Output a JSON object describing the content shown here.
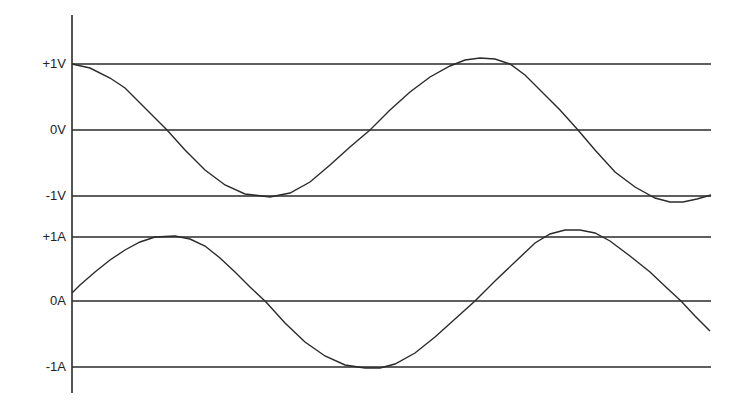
{
  "colors": {
    "line": "#2a2a2a",
    "background": "#ffffff"
  },
  "axis": {
    "x": 72,
    "y_top": 15,
    "y_bottom": 393,
    "x_end": 711
  },
  "voltage": {
    "labels": [
      {
        "text": "+1V",
        "y": 64
      },
      {
        "text": "0V",
        "y": 130
      },
      {
        "text": "-1V",
        "y": 196
      }
    ],
    "points": [
      [
        72,
        64
      ],
      [
        90,
        68
      ],
      [
        110,
        78
      ],
      [
        125,
        88
      ],
      [
        140,
        103
      ],
      [
        155,
        118
      ],
      [
        167,
        130
      ],
      [
        185,
        150
      ],
      [
        205,
        170
      ],
      [
        225,
        185
      ],
      [
        245,
        194
      ],
      [
        270,
        197
      ],
      [
        290,
        193
      ],
      [
        310,
        182
      ],
      [
        330,
        165
      ],
      [
        350,
        147
      ],
      [
        370,
        130
      ],
      [
        390,
        110
      ],
      [
        410,
        92
      ],
      [
        430,
        77
      ],
      [
        450,
        66
      ],
      [
        465,
        60
      ],
      [
        480,
        58
      ],
      [
        495,
        59
      ],
      [
        510,
        64
      ],
      [
        525,
        75
      ],
      [
        540,
        90
      ],
      [
        560,
        110
      ],
      [
        578,
        130
      ],
      [
        595,
        150
      ],
      [
        615,
        172
      ],
      [
        635,
        187
      ],
      [
        655,
        198
      ],
      [
        670,
        202
      ],
      [
        683,
        202
      ],
      [
        697,
        199
      ],
      [
        711,
        195
      ]
    ]
  },
  "current": {
    "labels": [
      {
        "text": "+1A",
        "y": 237
      },
      {
        "text": "0A",
        "y": 301
      },
      {
        "text": "-1A",
        "y": 367
      }
    ],
    "points": [
      [
        72,
        293
      ],
      [
        80,
        285
      ],
      [
        95,
        272
      ],
      [
        110,
        260
      ],
      [
        125,
        250
      ],
      [
        140,
        242
      ],
      [
        155,
        237
      ],
      [
        175,
        236
      ],
      [
        190,
        239
      ],
      [
        205,
        246
      ],
      [
        220,
        258
      ],
      [
        235,
        272
      ],
      [
        250,
        287
      ],
      [
        266,
        302
      ],
      [
        285,
        323
      ],
      [
        305,
        342
      ],
      [
        325,
        356
      ],
      [
        345,
        365
      ],
      [
        365,
        368
      ],
      [
        380,
        368
      ],
      [
        395,
        364
      ],
      [
        415,
        353
      ],
      [
        435,
        337
      ],
      [
        455,
        319
      ],
      [
        475,
        301
      ],
      [
        495,
        281
      ],
      [
        515,
        262
      ],
      [
        535,
        243
      ],
      [
        550,
        234
      ],
      [
        565,
        230
      ],
      [
        580,
        230
      ],
      [
        595,
        233
      ],
      [
        610,
        241
      ],
      [
        630,
        256
      ],
      [
        650,
        272
      ],
      [
        668,
        289
      ],
      [
        681,
        301
      ],
      [
        695,
        316
      ],
      [
        710,
        331
      ]
    ]
  },
  "gridlines_y": [
    64,
    130,
    196,
    237,
    301,
    367
  ]
}
